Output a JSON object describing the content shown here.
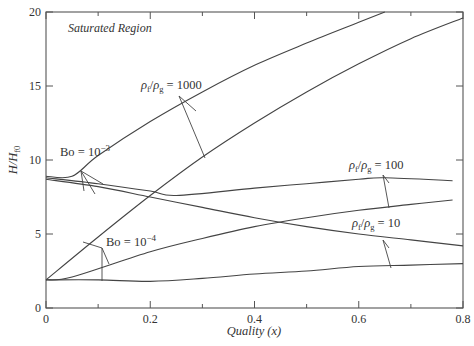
{
  "chart_data": {
    "type": "line",
    "title": "",
    "annotation": "Saturated Region",
    "xlabel": "Quality (x)",
    "ylabel": "H/H_{f0}",
    "xlim": [
      0,
      0.8
    ],
    "ylim": [
      0,
      20
    ],
    "xticks": [
      "0",
      "0.2",
      "0.4",
      "0.6",
      "0.8"
    ],
    "yticks": [
      "0",
      "5",
      "10",
      "15",
      "20"
    ],
    "grid": false,
    "series": [
      {
        "name": "ρf/ρg = 1000, Bo = 10^-3",
        "x": [
          0,
          0.05,
          0.1,
          0.2,
          0.3,
          0.4,
          0.5,
          0.6,
          0.65
        ],
        "y": [
          8.9,
          8.9,
          10.3,
          12.6,
          14.6,
          16.4,
          17.9,
          19.3,
          20.0
        ]
      },
      {
        "name": "ρf/ρg = 1000, Bo = 10^-4",
        "x": [
          0,
          0.1,
          0.2,
          0.3,
          0.4,
          0.5,
          0.6,
          0.7,
          0.8
        ],
        "y": [
          1.9,
          4.8,
          7.6,
          10.2,
          12.5,
          14.6,
          16.5,
          18.2,
          19.6
        ]
      },
      {
        "name": "ρf/ρg = 100, Bo = 10^-3",
        "x": [
          0,
          0.1,
          0.2,
          0.25,
          0.4,
          0.5,
          0.6,
          0.65,
          0.78
        ],
        "y": [
          8.8,
          8.4,
          7.9,
          7.6,
          8.1,
          8.4,
          8.7,
          8.8,
          8.6
        ]
      },
      {
        "name": "ρf/ρg = 100, Bo = 10^-4",
        "x": [
          0,
          0.05,
          0.2,
          0.3,
          0.4,
          0.5,
          0.6,
          0.7,
          0.78
        ],
        "y": [
          1.9,
          2.1,
          3.8,
          4.7,
          5.5,
          6.1,
          6.6,
          7.0,
          7.3
        ]
      },
      {
        "name": "ρf/ρg = 10, Bo = 10^-3",
        "x": [
          0,
          0.1,
          0.2,
          0.3,
          0.4,
          0.5,
          0.6,
          0.7,
          0.8
        ],
        "y": [
          8.7,
          8.2,
          7.5,
          6.8,
          6.1,
          5.5,
          5.0,
          4.6,
          4.2
        ]
      },
      {
        "name": "ρf/ρg = 10, Bo = 10^-4",
        "x": [
          0,
          0.1,
          0.2,
          0.3,
          0.4,
          0.5,
          0.6,
          0.7,
          0.8
        ],
        "y": [
          1.9,
          1.9,
          1.8,
          2.0,
          2.3,
          2.5,
          2.8,
          2.9,
          3.0
        ]
      }
    ],
    "labels": [
      {
        "text": "Bo = 10^-3",
        "x": 0.08,
        "y": 11.5
      },
      {
        "text": "Bo = 10^-4",
        "x": 0.14,
        "y": 5.2
      },
      {
        "text": "ρf/ρg = 1000",
        "x": 0.32,
        "y": 15.8
      },
      {
        "text": "ρf/ρg = 100",
        "x": 0.62,
        "y": 11.4
      },
      {
        "text": "ρf/ρg = 10",
        "x": 0.65,
        "y": 6.0
      }
    ]
  },
  "text": {
    "region": "Saturated Region",
    "xlabel": "Quality (x)",
    "ylabel_main": "H/H",
    "ylabel_sub": "f0",
    "bo3": "Bo = 10",
    "bo3_exp": "−3",
    "bo4": "Bo = 10",
    "bo4_exp": "−4",
    "r1000": "= 1000",
    "r100": "= 100",
    "r10": "= 10",
    "rho": "ρ",
    "sub_f": "f",
    "sub_g": "g"
  }
}
